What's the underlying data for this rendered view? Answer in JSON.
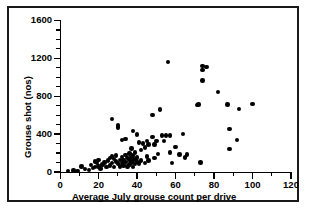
{
  "figure": {
    "border_color": "#1a1a1a",
    "background": "#ffffff",
    "marker_color": "#000000"
  },
  "chart_data": {
    "type": "scatter",
    "title": "",
    "xlabel": "Average July grouse count per drive",
    "ylabel": "Grouse shot (nos)",
    "xlim": [
      0,
      120
    ],
    "ylim": [
      0,
      1600
    ],
    "xticks": [
      0,
      20,
      40,
      60,
      80,
      100,
      120
    ],
    "yticks": [
      0,
      400,
      800,
      1200,
      1600
    ],
    "xtick_labels": [
      "0",
      "20",
      "40",
      "60",
      "80",
      "100",
      "120"
    ],
    "ytick_labels": [
      "0",
      "400",
      "800",
      "1200",
      "1600"
    ],
    "x_minor_step": 10,
    "y_minor_step": 100,
    "grid": false,
    "legend": null,
    "marker": "filled-circle",
    "series": [
      {
        "name": "Grouse shot vs July count",
        "points": [
          [
            4,
            10
          ],
          [
            7,
            15
          ],
          [
            9,
            12
          ],
          [
            11,
            60
          ],
          [
            13,
            30
          ],
          [
            15,
            20
          ],
          [
            16,
            75
          ],
          [
            17,
            45
          ],
          [
            18,
            55
          ],
          [
            18,
            110
          ],
          [
            19,
            95
          ],
          [
            20,
            60
          ],
          [
            20,
            130
          ],
          [
            21,
            35
          ],
          [
            22,
            80
          ],
          [
            23,
            100
          ],
          [
            24,
            55
          ],
          [
            25,
            120
          ],
          [
            26,
            150
          ],
          [
            26,
            70
          ],
          [
            27,
            560
          ],
          [
            27,
            165
          ],
          [
            27,
            95
          ],
          [
            28,
            140
          ],
          [
            28,
            55
          ],
          [
            29,
            175
          ],
          [
            29,
            110
          ],
          [
            30,
            470
          ],
          [
            30,
            490
          ],
          [
            30,
            90
          ],
          [
            31,
            130
          ],
          [
            31,
            60
          ],
          [
            32,
            340
          ],
          [
            32,
            160
          ],
          [
            32,
            95
          ],
          [
            33,
            125
          ],
          [
            33,
            70
          ],
          [
            34,
            350
          ],
          [
            34,
            180
          ],
          [
            34,
            105
          ],
          [
            35,
            145
          ],
          [
            35,
            60
          ],
          [
            36,
            195
          ],
          [
            36,
            130
          ],
          [
            36,
            80
          ],
          [
            37,
            250
          ],
          [
            37,
            160
          ],
          [
            37,
            100
          ],
          [
            38,
            430
          ],
          [
            38,
            175
          ],
          [
            38,
            120
          ],
          [
            38,
            55
          ],
          [
            39,
            205
          ],
          [
            39,
            140
          ],
          [
            39,
            85
          ],
          [
            40,
            395
          ],
          [
            40,
            155
          ],
          [
            40,
            110
          ],
          [
            41,
            310
          ],
          [
            41,
            90
          ],
          [
            42,
            230
          ],
          [
            42,
            120
          ],
          [
            43,
            300
          ],
          [
            44,
            260
          ],
          [
            44,
            95
          ],
          [
            45,
            165
          ],
          [
            45,
            330
          ],
          [
            46,
            290
          ],
          [
            46,
            120
          ],
          [
            48,
            600
          ],
          [
            48,
            370
          ],
          [
            49,
            290
          ],
          [
            49,
            150
          ],
          [
            50,
            330
          ],
          [
            51,
            190
          ],
          [
            52,
            660
          ],
          [
            53,
            385
          ],
          [
            54,
            330
          ],
          [
            55,
            385
          ],
          [
            56,
            1165
          ],
          [
            57,
            385
          ],
          [
            57,
            205
          ],
          [
            58,
            95
          ],
          [
            60,
            265
          ],
          [
            62,
            185
          ],
          [
            64,
            400
          ],
          [
            65,
            155
          ],
          [
            66,
            185
          ],
          [
            71,
            710
          ],
          [
            72,
            715
          ],
          [
            73,
            100
          ],
          [
            74,
            1120
          ],
          [
            74,
            1075
          ],
          [
            74,
            965
          ],
          [
            76,
            1110
          ],
          [
            82,
            845
          ],
          [
            87,
            715
          ],
          [
            88,
            455
          ],
          [
            88,
            245
          ],
          [
            92,
            340
          ],
          [
            93,
            665
          ],
          [
            100,
            720
          ]
        ]
      }
    ]
  }
}
